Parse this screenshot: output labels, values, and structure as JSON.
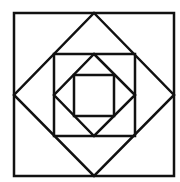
{
  "diagram": {
    "stroke_color": "#111111",
    "background": "#ffffff",
    "shapes": [
      {
        "name": "outer-square",
        "type": "square",
        "points": "14,13 174,13 174,176 14,176"
      },
      {
        "name": "diamond-1",
        "type": "diamond",
        "points": "94,13 174,95 94,176 14,95"
      },
      {
        "name": "middle-square",
        "type": "square",
        "points": "54,54 135,54 135,136 54,136"
      },
      {
        "name": "diamond-2",
        "type": "diamond",
        "points": "94,54 135,95 94,136 54,95"
      },
      {
        "name": "inner-square",
        "type": "square",
        "points": "74,75 114,75 114,116 74,116"
      }
    ]
  }
}
